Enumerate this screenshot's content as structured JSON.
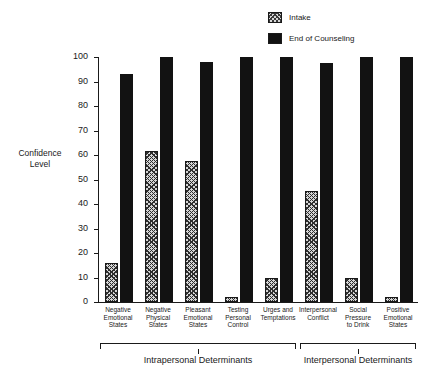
{
  "chart": {
    "ylabel_line1": "Confidence",
    "ylabel_line2": "Level"
  },
  "legend": {
    "items": [
      {
        "label": "Intake",
        "swatch": "hatched-swatch",
        "color": "#d5d5d5"
      },
      {
        "label": "End of Counseling",
        "swatch": "solid-swatch",
        "color": "#121212"
      }
    ]
  },
  "groups": [
    {
      "label": "Intrapersonal Determinants",
      "start_index": 0,
      "end_index": 4
    },
    {
      "label": "Interpersonal Determinants",
      "start_index": 5,
      "end_index": 7
    }
  ],
  "chart_data": {
    "type": "bar",
    "title": "",
    "xlabel": "",
    "ylabel": "Confidence Level",
    "ylim": [
      0,
      100
    ],
    "yticks": [
      0,
      10,
      20,
      30,
      40,
      50,
      60,
      70,
      80,
      90,
      100
    ],
    "grid": false,
    "legend_position": "top-right",
    "categories": [
      "Negative\nEmotional\nStates",
      "Negative\nPhysical\nStates",
      "Pleasant\nEmotional\nStates",
      "Testing\nPersonal\nControl",
      "Urges and\nTemptations",
      "Interpersonal\nConflict",
      "Social\nPressure\nto Drink",
      "Positive\nEmotional\nStates"
    ],
    "series": [
      {
        "name": "Intake",
        "values": [
          16,
          61.5,
          57.5,
          2,
          10,
          45.5,
          10,
          2
        ]
      },
      {
        "name": "End of Counseling",
        "values": [
          93,
          100,
          98,
          100,
          100,
          97.5,
          100,
          100
        ]
      }
    ],
    "group_annotations": [
      {
        "label": "Intrapersonal Determinants",
        "categories": 5
      },
      {
        "label": "Interpersonal Determinants",
        "categories": 3
      }
    ]
  }
}
